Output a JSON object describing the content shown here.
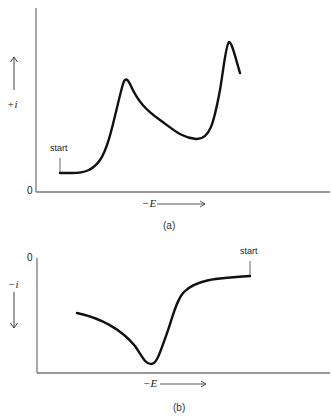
{
  "panel_a": {
    "y_axis_label": "+i",
    "y_origin_label": "0",
    "x_axis_label": "−E",
    "start_label": "start",
    "caption": "(a)",
    "curve_description": "Current rises from start at low +i, peaks, dips to a minimum, then rises to a second higher peak and falls"
  },
  "panel_b": {
    "y_axis_label": "−i",
    "y_origin_label": "0",
    "x_axis_label": "−E",
    "start_label": "start",
    "caption": "(b)",
    "curve_description": "Scan begins at start on right near zero current, sweeps toward left with current dropping sharply to a minimum then partially recovering"
  },
  "colors": {
    "curve": "#111111",
    "axis": "#666666",
    "background": "#ffffff"
  }
}
